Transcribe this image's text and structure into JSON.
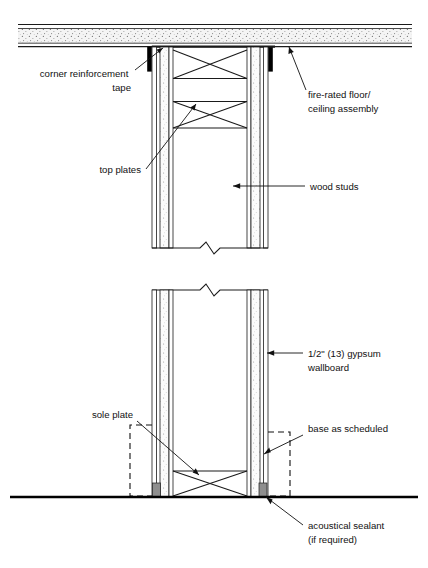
{
  "drawing": {
    "type": "architectural-detail-section",
    "title": "Wood stud partition at fire-rated floor/ceiling assembly",
    "background_color": "#ffffff",
    "line_color": "#111111",
    "tape_color": "#000000",
    "sealant_color": "#8e8e8e",
    "assembly_fill_color": "#f2f2f2"
  },
  "annotations": [
    {
      "key": "corner_reinforcement_tape",
      "lines": [
        "corner reinforcement",
        "tape"
      ],
      "align": "right",
      "text_x": 131,
      "text_y": 77,
      "leader": "M135,70 L163,48",
      "arrow_at": [
        163,
        48
      ],
      "arrow_angle": -38
    },
    {
      "key": "fire_rated_assembly",
      "lines": [
        "fire-rated floor/",
        "ceiling assembly"
      ],
      "align": "left",
      "text_x": 308,
      "text_y": 98,
      "leader": "M306,90 L289,47",
      "arrow_at": [
        289,
        47
      ],
      "arrow_angle": -112
    },
    {
      "key": "top_plates",
      "lines": [
        "top plates"
      ],
      "align": "right",
      "text_x": 141,
      "text_y": 173,
      "leader": "M146,169 L196,104",
      "arrow_at": [
        196,
        104
      ],
      "arrow_angle": -52
    },
    {
      "key": "wood_studs",
      "lines": [
        "wood studs"
      ],
      "align": "left",
      "text_x": 310,
      "text_y": 190,
      "leader": "M305,186 L233,186",
      "arrow_at": [
        233,
        186
      ],
      "arrow_angle": 180
    },
    {
      "key": "gypsum_wallboard",
      "lines": [
        "1/2\" (13) gypsum",
        "wallboard"
      ],
      "align": "left",
      "text_x": 308,
      "text_y": 357,
      "leader": "M303,353 L267,353",
      "arrow_at": [
        267,
        353
      ],
      "arrow_angle": 180
    },
    {
      "key": "sole_plate",
      "lines": [
        "sole plate"
      ],
      "align": "right",
      "text_x": 133,
      "text_y": 418,
      "leader": "M137,421 L199,475",
      "arrow_at": [
        199,
        475
      ],
      "arrow_angle": 41
    },
    {
      "key": "base_as_scheduled",
      "lines": [
        "base as scheduled"
      ],
      "align": "left",
      "text_x": 308,
      "text_y": 432,
      "leader": "M303,435 L264,454",
      "arrow_at": [
        264,
        454
      ],
      "arrow_angle": 154
    },
    {
      "key": "acoustical_sealant",
      "lines": [
        "acoustical sealant",
        "(if required)"
      ],
      "align": "left",
      "text_x": 308,
      "text_y": 529,
      "leader": "M303,525 L266,497",
      "arrow_at": [
        266,
        497
      ],
      "arrow_angle": -143
    }
  ],
  "geometry": {
    "ceiling_assembly": {
      "left": 18,
      "right": 412,
      "top_line_y": 25,
      "band_top": 29,
      "band_bottom": 43,
      "bottom_line_y": 45,
      "soffit_y": 47
    },
    "wall_left": {
      "outer_x": 152,
      "inner_x": 172,
      "gyp_thickness": 4
    },
    "wall_right": {
      "inner_x": 248,
      "outer_x": 268,
      "gyp_thickness": 4
    },
    "upper_section": {
      "top_y": 47,
      "bottom_y": 248,
      "plate_y1": 78,
      "plate_y2": 101,
      "brace_top_y": 50,
      "brace_bottom_y": 128
    },
    "lower_section": {
      "top_y": 290,
      "floor_y": 497,
      "sole_plate_y": 471
    },
    "break_lines": {
      "upper_y": 248,
      "lower_y": 290,
      "x_center": 210
    },
    "floor_line": {
      "left": 10,
      "right": 418,
      "y": 497
    },
    "base_boxes": {
      "left": {
        "x": 130,
        "y": 425,
        "w": 22,
        "h": 72
      },
      "right": {
        "x": 268,
        "y": 432,
        "w": 22,
        "h": 65
      }
    },
    "sealant_blocks": [
      {
        "x": 153,
        "y": 483,
        "w": 8,
        "h": 14
      },
      {
        "x": 259,
        "y": 483,
        "w": 8,
        "h": 14
      }
    ],
    "corner_tape": [
      {
        "x": 148,
        "y": 47,
        "w": 4,
        "h": 24
      },
      {
        "x": 268,
        "y": 47,
        "w": 4,
        "h": 24
      }
    ]
  }
}
